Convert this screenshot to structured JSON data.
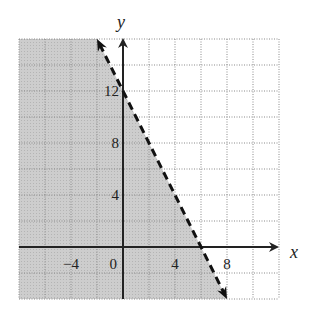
{
  "chart_data": {
    "type": "line",
    "title": "",
    "xlabel": "x",
    "ylabel": "y",
    "xlim": [
      -8,
      12
    ],
    "ylim": [
      -4,
      16
    ],
    "grid": true,
    "grid_step": 2,
    "x_ticks": [
      {
        "value": -4,
        "label": "−4"
      },
      {
        "value": 0,
        "label": "0"
      },
      {
        "value": 4,
        "label": "4"
      },
      {
        "value": 8,
        "label": "8"
      }
    ],
    "y_ticks": [
      {
        "value": 4,
        "label": "4"
      },
      {
        "value": 8,
        "label": "8"
      },
      {
        "value": 12,
        "label": "12"
      }
    ],
    "series": [
      {
        "name": "boundary",
        "equation": "y = -2x + 12",
        "style": "dashed",
        "x": [
          -2,
          0,
          6,
          8
        ],
        "y": [
          16,
          12,
          0,
          -4
        ]
      }
    ],
    "shaded_region": "below boundary line",
    "colors": {
      "shade": "#c8c8c8",
      "grid": "#8a8a8a",
      "axis": "#222222",
      "line": "#111111",
      "background": "#ffffff"
    }
  }
}
